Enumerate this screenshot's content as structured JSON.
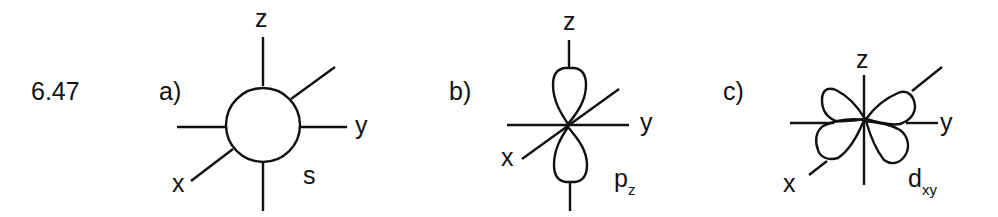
{
  "problem_number": "6.47",
  "stroke_color": "#111111",
  "background": "#ffffff",
  "panels": [
    {
      "id": "a",
      "label": "a)",
      "orbital": "s",
      "orbital_main": "s",
      "orbital_sub": "",
      "axes": {
        "z": "z",
        "y": "y",
        "x": "x"
      },
      "shape": "sphere"
    },
    {
      "id": "b",
      "label": "b)",
      "orbital": "pz",
      "orbital_main": "p",
      "orbital_sub": "z",
      "axes": {
        "z": "z",
        "y": "y",
        "x": "x"
      },
      "shape": "two-lobes-along-z"
    },
    {
      "id": "c",
      "label": "c)",
      "orbital": "dxy",
      "orbital_main": "d",
      "orbital_sub": "xy",
      "axes": {
        "z": "z",
        "y": "y",
        "x": "x"
      },
      "shape": "four-lobes-in-xy-plane"
    }
  ]
}
